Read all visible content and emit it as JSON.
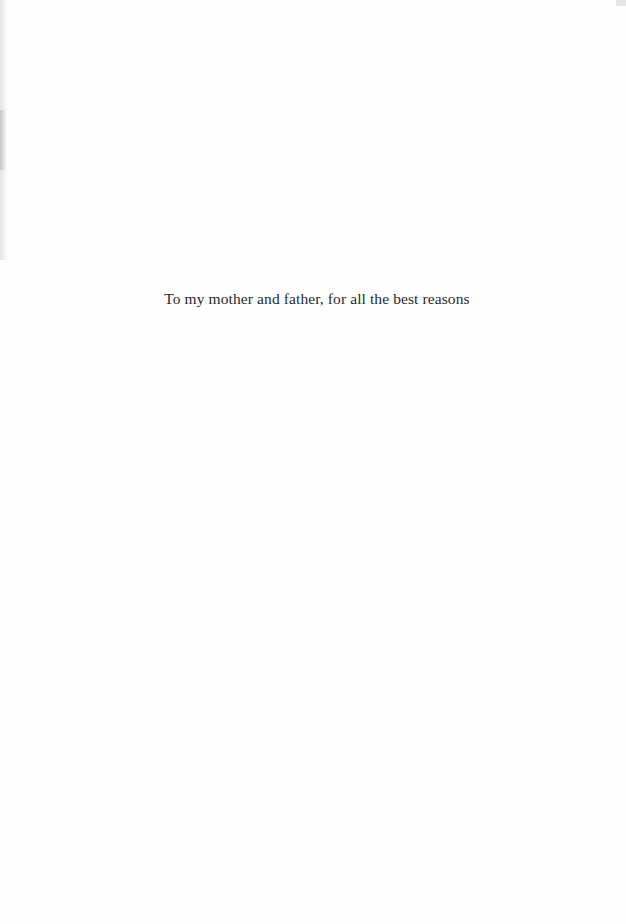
{
  "page": {
    "dedication": "To my mother and father, for all the best reasons"
  }
}
